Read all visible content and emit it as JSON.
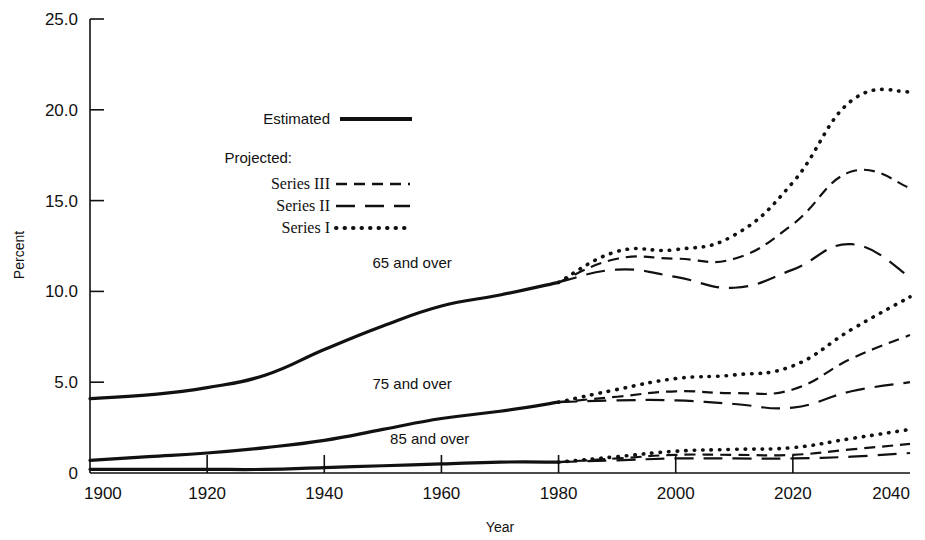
{
  "chart_data": {
    "type": "line",
    "title": "",
    "xlabel": "Year",
    "ylabel": "Percent",
    "xlim": [
      1900,
      2040
    ],
    "ylim": [
      0,
      25
    ],
    "grid": false,
    "xticks": [
      1900,
      1920,
      1940,
      1960,
      1980,
      2000,
      2020,
      2040
    ],
    "xtick_labels": [
      "1900",
      "1920",
      "1940",
      "1960",
      "1980",
      "2000",
      "2020",
      "2040"
    ],
    "yticks": [
      0,
      5,
      10,
      15,
      20,
      25
    ],
    "ytick_labels": [
      "0",
      "5.0",
      "10.0",
      "15.0",
      "20.0",
      "25.0"
    ],
    "legend": {
      "position": "upper-left-inside",
      "entries": [
        {
          "label": "Estimated",
          "style": "solid"
        },
        {
          "label": "Projected:",
          "style": "heading"
        },
        {
          "label": "Series III",
          "style": "dashed-short"
        },
        {
          "label": "Series II",
          "style": "dashed-long"
        },
        {
          "label": "Series I",
          "style": "dotted"
        }
      ]
    },
    "annotations": [
      {
        "text": "65 and over",
        "x": 1955,
        "y": 11.3
      },
      {
        "text": "75 and over",
        "x": 1955,
        "y": 4.6
      },
      {
        "text": "85 and over",
        "x": 1958,
        "y": 1.6
      }
    ],
    "series": [
      {
        "name": "65 and over — Estimated",
        "group": "65 and over",
        "style": "solid",
        "x": [
          1900,
          1910,
          1920,
          1930,
          1940,
          1950,
          1960,
          1970,
          1980
        ],
        "values": [
          4.1,
          4.3,
          4.7,
          5.4,
          6.8,
          8.1,
          9.2,
          9.8,
          10.5
        ]
      },
      {
        "name": "65 and over — Series I",
        "group": "65 and over",
        "style": "dotted",
        "x": [
          1980,
          1990,
          2000,
          2010,
          2020,
          2030,
          2040
        ],
        "values": [
          10.5,
          12.2,
          12.3,
          13.1,
          16.0,
          20.5,
          21.0
        ]
      },
      {
        "name": "65 and over — Series III",
        "group": "65 and over",
        "style": "dashed-short",
        "x": [
          1980,
          1990,
          2000,
          2010,
          2020,
          2030,
          2040
        ],
        "values": [
          10.5,
          11.8,
          11.8,
          11.8,
          13.7,
          16.6,
          15.7
        ]
      },
      {
        "name": "65 and over — Series II",
        "group": "65 and over",
        "style": "dashed-long",
        "x": [
          1980,
          1990,
          2000,
          2010,
          2020,
          2030,
          2040
        ],
        "values": [
          10.5,
          11.2,
          10.8,
          10.2,
          11.2,
          12.6,
          10.8
        ]
      },
      {
        "name": "75 and over — Estimated",
        "group": "75 and over",
        "style": "solid",
        "x": [
          1900,
          1910,
          1920,
          1930,
          1940,
          1950,
          1960,
          1970,
          1980
        ],
        "values": [
          0.7,
          0.9,
          1.1,
          1.4,
          1.8,
          2.4,
          3.0,
          3.4,
          3.9
        ]
      },
      {
        "name": "75 and over — Series I",
        "group": "75 and over",
        "style": "dotted",
        "x": [
          1980,
          1990,
          2000,
          2010,
          2020,
          2030,
          2040
        ],
        "values": [
          3.9,
          4.6,
          5.2,
          5.4,
          5.9,
          7.9,
          9.7
        ]
      },
      {
        "name": "75 and over — Series III",
        "group": "75 and over",
        "style": "dashed-short",
        "x": [
          1980,
          1990,
          2000,
          2010,
          2020,
          2030,
          2040
        ],
        "values": [
          3.9,
          4.2,
          4.5,
          4.4,
          4.6,
          6.3,
          7.6
        ]
      },
      {
        "name": "75 and over — Series II",
        "group": "75 and over",
        "style": "dashed-long",
        "x": [
          1980,
          1990,
          2000,
          2010,
          2020,
          2030,
          2040
        ],
        "values": [
          3.9,
          4.0,
          4.0,
          3.8,
          3.6,
          4.5,
          5.0
        ]
      },
      {
        "name": "85 and over — Estimated",
        "group": "85 and over",
        "style": "solid",
        "x": [
          1900,
          1910,
          1920,
          1930,
          1940,
          1950,
          1960,
          1970,
          1980
        ],
        "values": [
          0.2,
          0.2,
          0.2,
          0.2,
          0.3,
          0.4,
          0.5,
          0.6,
          0.6
        ]
      },
      {
        "name": "85 and over — Series I",
        "group": "85 and over",
        "style": "dotted",
        "x": [
          1980,
          1990,
          2000,
          2010,
          2020,
          2030,
          2040
        ],
        "values": [
          0.6,
          0.9,
          1.2,
          1.3,
          1.4,
          1.9,
          2.4
        ]
      },
      {
        "name": "85 and over — Series III",
        "group": "85 and over",
        "style": "dashed-short",
        "x": [
          1980,
          1990,
          2000,
          2010,
          2020,
          2030,
          2040
        ],
        "values": [
          0.6,
          0.8,
          1.0,
          1.0,
          1.0,
          1.3,
          1.6
        ]
      },
      {
        "name": "85 and over — Series II",
        "group": "85 and over",
        "style": "dashed-long",
        "x": [
          1980,
          1990,
          2000,
          2010,
          2020,
          2030,
          2040
        ],
        "values": [
          0.6,
          0.7,
          0.8,
          0.8,
          0.8,
          0.9,
          1.1
        ]
      }
    ]
  }
}
